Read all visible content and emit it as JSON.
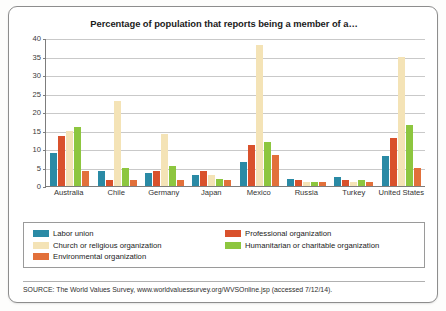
{
  "chart_data": {
    "type": "bar",
    "title": "Percentage of population that reports being a member of a…",
    "xlabel": "",
    "ylabel": "",
    "ylim": [
      0,
      40
    ],
    "yticks": [
      0,
      5,
      10,
      15,
      20,
      25,
      30,
      35,
      40
    ],
    "grid": true,
    "legend_position": "bottom",
    "categories": [
      "Australia",
      "Chile",
      "Germany",
      "Japan",
      "Mexico",
      "Russia",
      "Turkey",
      "United States"
    ],
    "series": [
      {
        "name": "Labor union",
        "color": "#2a8aa5",
        "values": [
          9,
          4,
          3.5,
          3,
          6.5,
          2,
          2.5,
          8
        ]
      },
      {
        "name": "Professional organization",
        "color": "#d9512c",
        "values": [
          13.5,
          1.5,
          4,
          4,
          11,
          1.5,
          1.5,
          13
        ]
      },
      {
        "name": "Church or religious organization",
        "color": "#f4e3b6",
        "values": [
          15,
          23,
          14,
          3,
          38,
          1,
          1,
          35
        ]
      },
      {
        "name": "Humanitarian or charitable organization",
        "color": "#8dc63f",
        "values": [
          16,
          5,
          5.5,
          2,
          12,
          1,
          1.5,
          16.5
        ]
      },
      {
        "name": "Environmental organization",
        "color": "#e2703a",
        "values": [
          4,
          1.5,
          1.5,
          1.5,
          8.5,
          1,
          1,
          5
        ]
      }
    ]
  },
  "source": {
    "text": "SOURCE: The World Values Survey, www.worldvaluessurvey.org/WVSOnline.jsp (accessed 7/12/14)."
  }
}
